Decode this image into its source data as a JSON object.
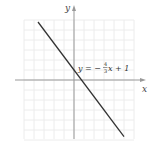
{
  "chart_data": {
    "type": "line",
    "title": "",
    "xlabel": "x",
    "ylabel": "y",
    "xlim": [
      -6,
      7
    ],
    "ylim": [
      -6,
      7.5
    ],
    "grid": true,
    "series": [
      {
        "name": "y = -4/3 x + 1",
        "slope": -1.3333,
        "intercept": 1,
        "x": [
          -3.6,
          5
        ],
        "y": [
          5.8,
          -5.67
        ]
      }
    ],
    "annotations": [
      {
        "text": "y = −4/3 x + 1",
        "x": 0.2,
        "y": 1.2
      }
    ]
  },
  "labels": {
    "x_axis": "x",
    "y_axis": "y",
    "eq_lhs": "y = −",
    "eq_num": "4",
    "eq_den": "3",
    "eq_rhs": "x + 1"
  },
  "colors": {
    "line": "#333333",
    "axis": "#888888",
    "grid": "#ececec"
  }
}
